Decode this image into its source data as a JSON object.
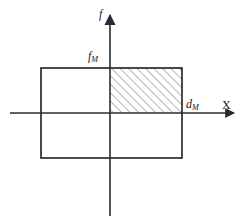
{
  "figure": {
    "labels": {
      "vertical_axis": "f",
      "vertical_axis_name": "f-axis-label",
      "horizontal_axis": "X",
      "horizontal_axis_name": "x-axis-label",
      "f_max_base": "f",
      "f_max_sub": "M",
      "d_max_base": "d",
      "d_max_sub": "M"
    },
    "colors": {
      "background": "#ffffff",
      "axis": "#2b2b2b",
      "rectangle_stroke": "#1f1f1f",
      "hatch_stroke": "#6e6e6e",
      "text": "#1a1a1a"
    },
    "geometry": {
      "origin_x": 110,
      "origin_y": 113,
      "rect_left": 41,
      "rect_right": 182,
      "rect_top": 68,
      "rect_bottom": 158,
      "x_axis_start": 10,
      "x_axis_end": 236,
      "f_axis_top": 12,
      "f_axis_bottom": 216,
      "hatch_spacing": 6,
      "hatch_angle_deg": 45
    },
    "hatched_region": {
      "name": "hatched-quadrant",
      "x_from": 0,
      "x_to": "d_M",
      "y_from": 0,
      "y_to": "f_M"
    }
  }
}
